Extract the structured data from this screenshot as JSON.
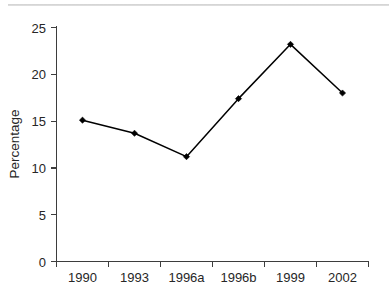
{
  "chart_data": {
    "type": "line",
    "title": "",
    "xlabel": "",
    "ylabel": "Percentage",
    "categories": [
      "1990",
      "1993",
      "1996a",
      "1996b",
      "1999",
      "2002"
    ],
    "values": [
      15.1,
      13.7,
      11.2,
      17.4,
      23.2,
      18.0
    ],
    "series": [
      {
        "name": "Percentage",
        "values": [
          15.1,
          13.7,
          11.2,
          17.4,
          23.2,
          18.0
        ]
      }
    ],
    "ylim": [
      0,
      25
    ],
    "y_ticks": [
      0,
      5,
      10,
      15,
      20,
      25
    ],
    "y_tick_labels": [
      "0",
      "5",
      "10",
      "15",
      "20",
      "25"
    ],
    "grid": false,
    "legend": "none",
    "line_color": "#000000",
    "marker_color": "#000000",
    "marker": "diamond",
    "axis_color": "#3d3d3d",
    "background_color": "#ffffff"
  },
  "axes": {
    "y_axis_title": "Percentage",
    "x_axis_title": ""
  }
}
